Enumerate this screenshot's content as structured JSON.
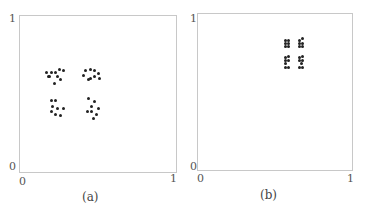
{
  "chart_data": [
    {
      "type": "scatter",
      "title": "",
      "caption": "(a)",
      "xlabel": "",
      "ylabel": "",
      "xlim": [
        0,
        1
      ],
      "ylim": [
        0,
        1
      ],
      "x_ticks": [
        "0",
        "1"
      ],
      "y_ticks": [
        "0",
        "1"
      ],
      "grid": false,
      "clusters": [
        {
          "name": "upper-left",
          "points": [
            [
              0.17,
              0.64
            ],
            [
              0.2,
              0.64
            ],
            [
              0.23,
              0.64
            ],
            [
              0.25,
              0.66
            ],
            [
              0.28,
              0.65
            ],
            [
              0.19,
              0.61
            ],
            [
              0.24,
              0.61
            ],
            [
              0.26,
              0.59
            ],
            [
              0.22,
              0.57
            ],
            [
              0.18,
              0.61
            ]
          ]
        },
        {
          "name": "upper-right",
          "points": [
            [
              0.42,
              0.65
            ],
            [
              0.45,
              0.66
            ],
            [
              0.48,
              0.65
            ],
            [
              0.5,
              0.63
            ],
            [
              0.41,
              0.62
            ],
            [
              0.45,
              0.6
            ],
            [
              0.48,
              0.61
            ],
            [
              0.51,
              0.6
            ],
            [
              0.44,
              0.59
            ]
          ]
        },
        {
          "name": "lower-left",
          "points": [
            [
              0.2,
              0.46
            ],
            [
              0.23,
              0.46
            ],
            [
              0.21,
              0.42
            ],
            [
              0.24,
              0.41
            ],
            [
              0.28,
              0.41
            ],
            [
              0.2,
              0.39
            ],
            [
              0.23,
              0.37
            ],
            [
              0.26,
              0.36
            ]
          ]
        },
        {
          "name": "lower-right",
          "points": [
            [
              0.44,
              0.47
            ],
            [
              0.48,
              0.45
            ],
            [
              0.46,
              0.42
            ],
            [
              0.5,
              0.41
            ],
            [
              0.43,
              0.39
            ],
            [
              0.46,
              0.39
            ],
            [
              0.49,
              0.37
            ],
            [
              0.47,
              0.34
            ]
          ]
        }
      ]
    },
    {
      "type": "scatter",
      "title": "",
      "caption": "(b)",
      "xlabel": "",
      "ylabel": "",
      "xlim": [
        0,
        1
      ],
      "ylim": [
        0,
        1
      ],
      "x_ticks": [
        "0",
        "1"
      ],
      "y_ticks": [
        "0",
        "1"
      ],
      "grid": false,
      "clusters": [
        {
          "name": "upper-left",
          "points": [
            [
              0.57,
              0.83
            ],
            [
              0.59,
              0.83
            ],
            [
              0.57,
              0.81
            ],
            [
              0.59,
              0.81
            ],
            [
              0.57,
              0.79
            ],
            [
              0.59,
              0.79
            ]
          ]
        },
        {
          "name": "upper-right",
          "points": [
            [
              0.66,
              0.83
            ],
            [
              0.68,
              0.84
            ],
            [
              0.66,
              0.81
            ],
            [
              0.68,
              0.81
            ],
            [
              0.66,
              0.79
            ],
            [
              0.68,
              0.79
            ]
          ]
        },
        {
          "name": "lower-left",
          "points": [
            [
              0.57,
              0.72
            ],
            [
              0.59,
              0.73
            ],
            [
              0.57,
              0.7
            ],
            [
              0.59,
              0.7
            ],
            [
              0.57,
              0.68
            ],
            [
              0.57,
              0.66
            ],
            [
              0.59,
              0.66
            ]
          ]
        },
        {
          "name": "lower-right",
          "points": [
            [
              0.66,
              0.72
            ],
            [
              0.68,
              0.73
            ],
            [
              0.66,
              0.7
            ],
            [
              0.68,
              0.7
            ],
            [
              0.67,
              0.68
            ],
            [
              0.66,
              0.66
            ],
            [
              0.68,
              0.66
            ]
          ]
        }
      ]
    }
  ]
}
